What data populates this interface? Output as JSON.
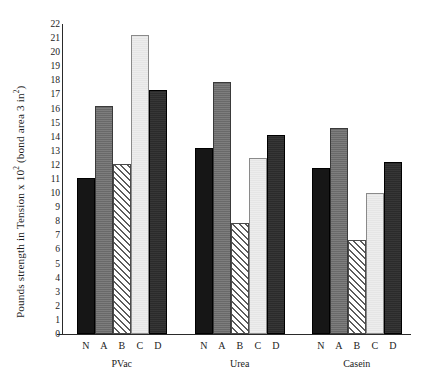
{
  "chart_data": {
    "type": "bar",
    "title": "",
    "xlabel": "",
    "ylabel": "Pounds strength in Tension x 10² (bond area 3 in²)",
    "ylabel_parts": {
      "before_exp1": "Pounds strength in Tension x 10",
      "exp1": "2",
      "middle": " (bond area 3 in",
      "exp2": "2",
      "after": ")"
    },
    "ylim": [
      0,
      22
    ],
    "yticks": [
      0,
      1,
      2,
      3,
      4,
      5,
      6,
      7,
      8,
      9,
      10,
      11,
      12,
      13,
      14,
      15,
      16,
      17,
      18,
      19,
      20,
      21,
      22
    ],
    "ytick_labels": [
      "0",
      "1",
      "2",
      "3",
      "4",
      "5",
      "6",
      "7",
      "8",
      "9",
      "10",
      "11",
      "12",
      "13",
      "14",
      "15",
      "16",
      "17",
      "18",
      "19",
      "20",
      "21",
      "22"
    ],
    "grid": false,
    "legend": "none",
    "categories": [
      "PVac",
      "Urea",
      "Casein"
    ],
    "bar_labels": [
      "N",
      "A",
      "B",
      "C",
      "D"
    ],
    "series": [
      {
        "name": "N",
        "values": [
          11.1,
          13.2,
          11.8
        ],
        "fill": "solid-black",
        "color": "#161616"
      },
      {
        "name": "A",
        "values": [
          16.2,
          17.9,
          14.6
        ],
        "fill": "solid-gray",
        "color": "#6f6f6f"
      },
      {
        "name": "B",
        "values": [
          12.1,
          7.9,
          6.7
        ],
        "fill": "diagonal-hatch",
        "color": "#ffffff"
      },
      {
        "name": "C",
        "values": [
          21.2,
          12.5,
          10.0
        ],
        "fill": "solid-light",
        "color": "#ededed"
      },
      {
        "name": "D",
        "values": [
          17.3,
          14.1,
          12.2
        ],
        "fill": "solid-darkgray",
        "color": "#2b2b2b"
      }
    ],
    "groups": [
      {
        "label": "PVac",
        "bars": [
          {
            "label": "N",
            "value": 11.1,
            "style": "N"
          },
          {
            "label": "A",
            "value": 16.2,
            "style": "A"
          },
          {
            "label": "B",
            "value": 12.1,
            "style": "B"
          },
          {
            "label": "C",
            "value": 21.2,
            "style": "C"
          },
          {
            "label": "D",
            "value": 17.3,
            "style": "D"
          }
        ]
      },
      {
        "label": "Urea",
        "bars": [
          {
            "label": "N",
            "value": 13.2,
            "style": "N"
          },
          {
            "label": "A",
            "value": 17.9,
            "style": "A"
          },
          {
            "label": "B",
            "value": 7.9,
            "style": "B"
          },
          {
            "label": "C",
            "value": 12.5,
            "style": "C"
          },
          {
            "label": "D",
            "value": 14.1,
            "style": "D"
          }
        ]
      },
      {
        "label": "Casein",
        "bars": [
          {
            "label": "N",
            "value": 11.8,
            "style": "N"
          },
          {
            "label": "A",
            "value": 14.6,
            "style": "A"
          },
          {
            "label": "B",
            "value": 6.7,
            "style": "B"
          },
          {
            "label": "C",
            "value": 10.0,
            "style": "C"
          },
          {
            "label": "D",
            "value": 12.2,
            "style": "D"
          }
        ]
      }
    ]
  },
  "colors": {
    "axis": "#2a2a2a",
    "text": "#1c1c1c",
    "bar_n": "#161616",
    "bar_a": "#6f6f6f",
    "bar_b": "#ffffff",
    "bar_c": "#ededed",
    "bar_d": "#2b2b2b"
  }
}
